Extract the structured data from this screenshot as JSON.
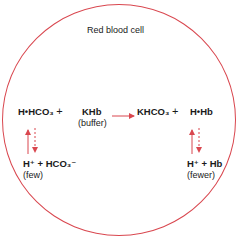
{
  "diagram": {
    "title": "Red blood cell",
    "accent_color": "#d9474f",
    "left_reactant_1": "H•HCO₃",
    "plus_1": "+",
    "left_reactant_2": "KHb",
    "left_reactant_2_label": "(buffer)",
    "right_product_1": "KHCO₃",
    "plus_2": "+",
    "right_product_2": "H•Hb",
    "left_dissociation": "H⁺ + HCO₃⁻",
    "left_dissociation_label": "(few)",
    "right_dissociation": "H⁺ + Hb",
    "right_dissociation_label": "(fewer)",
    "arrows": [
      {
        "from": "reactants",
        "to": "products",
        "style": "solid",
        "direction": "right"
      },
      {
        "from": "H•HCO₃",
        "to": "H⁺ + HCO₃⁻",
        "style": "equilibrium",
        "up": "solid",
        "down": "dashed"
      },
      {
        "from": "H•Hb",
        "to": "H⁺ + Hb",
        "style": "equilibrium",
        "up": "solid",
        "down": "dashed"
      }
    ]
  }
}
